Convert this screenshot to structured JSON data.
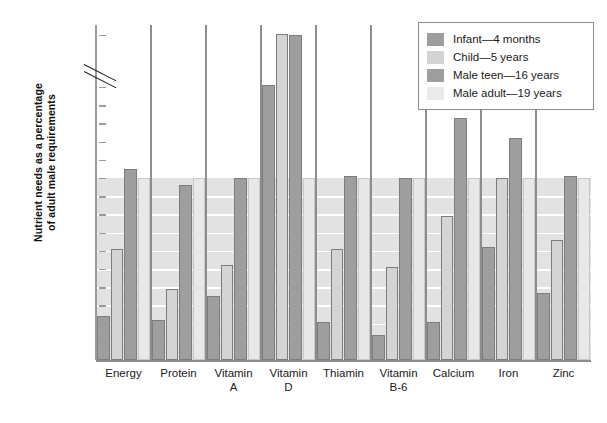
{
  "chart_data": {
    "type": "bar",
    "title": "",
    "xlabel": "",
    "ylabel": "Nutrient needs as a percentage of adult male requirements",
    "ylim": [
      0,
      205
    ],
    "axis_break": {
      "from": 150,
      "to": 200
    },
    "grid": true,
    "legend_position": "top-right",
    "ytick_labels": [
      "200",
      "150",
      "140",
      "130",
      "120",
      "110",
      "100",
      "90",
      "80",
      "70",
      "60",
      "50",
      "40",
      "30",
      "20",
      "10"
    ],
    "ytick_values": [
      200,
      150,
      140,
      130,
      120,
      110,
      100,
      90,
      80,
      70,
      60,
      50,
      40,
      30,
      20,
      10
    ],
    "emphasized_tick": "100",
    "shaded_band": [
      0,
      100
    ],
    "categories": [
      "Energy",
      "Protein",
      "Vitamin A",
      "Vitamin D",
      "Thiamin",
      "Vitamin B-6",
      "Calcium",
      "Iron",
      "Zinc"
    ],
    "category_lines": [
      [
        "Energy"
      ],
      [
        "Protein"
      ],
      [
        "Vitamin",
        "A"
      ],
      [
        "Vitamin",
        "D"
      ],
      [
        "Thiamin"
      ],
      [
        "Vitamin",
        "B-6"
      ],
      [
        "Calcium"
      ],
      [
        "Iron"
      ],
      [
        "Zinc"
      ]
    ],
    "series": [
      {
        "name": "Infant—4 months",
        "key": "infant",
        "color": "#9e9e9e",
        "values": [
          24,
          22,
          35,
          152,
          21,
          14,
          21,
          62,
          37
        ]
      },
      {
        "name": "Child—5 years",
        "key": "child",
        "color": "#d4d4d4",
        "values": [
          61,
          39,
          52,
          201,
          61,
          51,
          79,
          100,
          66
        ]
      },
      {
        "name": "Male teen—16 years",
        "key": "teen",
        "color": "#9e9e9e",
        "values": [
          105,
          96,
          100,
          200,
          101,
          100,
          133,
          122,
          101
        ]
      },
      {
        "name": "Male adult—19 years",
        "key": "adult",
        "color": "#e8e8e8",
        "values": [
          100,
          100,
          100,
          100,
          100,
          100,
          100,
          100,
          100
        ]
      }
    ]
  },
  "legend": {
    "items": [
      {
        "label": "Infant—4 months",
        "swatch": "infant"
      },
      {
        "label": "Child—5 years",
        "swatch": "child"
      },
      {
        "label": "Male teen—16 years",
        "swatch": "teen"
      },
      {
        "label": "Male adult—19 years",
        "swatch": "adult"
      }
    ]
  },
  "axis_title": {
    "line1": "Nutrient needs as a percentage",
    "line2": "of adult male requirements"
  },
  "colors": {
    "infant": "#9e9e9e",
    "child": "#d4d4d4",
    "teen": "#9e9e9e",
    "adult": "#e8e8e8",
    "band": "#e2e2e2",
    "axis": "#8d8d8d",
    "text": "#1a1a1a"
  }
}
